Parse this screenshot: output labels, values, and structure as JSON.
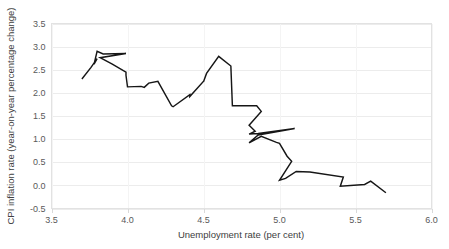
{
  "chart_data": {
    "type": "line",
    "title": "",
    "xlabel": "Unemployment rate (per cent)",
    "ylabel": "CPI inflation rate (year-on-year percentage change)",
    "xlim": [
      3.5,
      6.0
    ],
    "ylim": [
      -0.5,
      3.5
    ],
    "xticks": [
      "3.5",
      "4.0",
      "4.5",
      "5.0",
      "5.5",
      "6.0"
    ],
    "xtick_values": [
      3.5,
      4.0,
      4.5,
      5.0,
      5.5,
      6.0
    ],
    "yticks": [
      "-0.5",
      "0.0",
      "0.5",
      "1.0",
      "1.5",
      "2.0",
      "2.5",
      "3.0",
      "3.5"
    ],
    "ytick_values": [
      -0.5,
      0.0,
      0.5,
      1.0,
      1.5,
      2.0,
      2.5,
      3.0,
      3.5
    ],
    "grid": true,
    "grid_axis": "y",
    "legend": "none",
    "series_name": "Unemployment vs CPI inflation path",
    "line_color": "#161616",
    "grid_color": "#ececec",
    "background_color": "#ffffff",
    "points": [
      [
        3.7,
        2.3
      ],
      [
        3.76,
        2.55
      ],
      [
        3.8,
        2.74
      ],
      [
        3.78,
        2.62
      ],
      [
        3.8,
        2.9
      ],
      [
        3.84,
        2.84
      ],
      [
        3.99,
        2.85
      ],
      [
        3.82,
        2.76
      ],
      [
        3.9,
        2.62
      ],
      [
        3.99,
        2.45
      ],
      [
        3.99,
        2.38
      ],
      [
        4.0,
        2.13
      ],
      [
        4.09,
        2.14
      ],
      [
        4.11,
        2.12
      ],
      [
        4.14,
        2.21
      ],
      [
        4.2,
        2.25
      ],
      [
        4.29,
        1.72
      ],
      [
        4.3,
        1.7
      ],
      [
        4.41,
        1.96
      ],
      [
        4.41,
        1.92
      ],
      [
        4.5,
        2.25
      ],
      [
        4.5,
        2.24
      ],
      [
        4.52,
        2.42
      ],
      [
        4.6,
        2.79
      ],
      [
        4.68,
        2.58
      ],
      [
        4.69,
        1.72
      ],
      [
        4.85,
        1.72
      ],
      [
        4.88,
        1.6
      ],
      [
        4.8,
        1.3
      ],
      [
        4.84,
        1.17
      ],
      [
        4.8,
        1.11
      ],
      [
        4.86,
        1.12
      ],
      [
        5.1,
        1.23
      ],
      [
        4.86,
        1.09
      ],
      [
        4.8,
        0.92
      ],
      [
        4.88,
        1.06
      ],
      [
        4.98,
        0.93
      ],
      [
        5.0,
        0.91
      ],
      [
        5.05,
        0.63
      ],
      [
        5.08,
        0.52
      ],
      [
        5.0,
        0.11
      ],
      [
        5.04,
        0.15
      ],
      [
        5.11,
        0.3
      ],
      [
        5.2,
        0.29
      ],
      [
        5.42,
        0.18
      ],
      [
        5.4,
        -0.02
      ],
      [
        5.56,
        0.02
      ],
      [
        5.6,
        0.09
      ],
      [
        5.7,
        -0.16
      ]
    ]
  }
}
